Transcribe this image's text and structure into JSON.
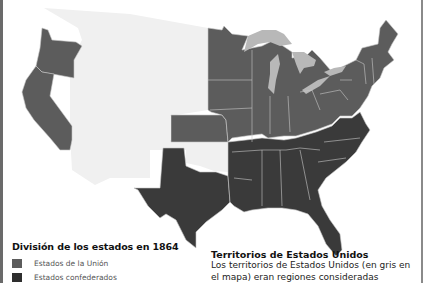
{
  "map": {
    "subject": "United States states in 1864",
    "colors": {
      "union": "#5c5c5c",
      "confederate": "#3a3a3a",
      "territory": "#f0f0f0",
      "lakes": "#b8b8b8",
      "borders": "#c8c8c8",
      "background": "#ffffff"
    },
    "regions": [
      {
        "name": "Oregon",
        "status": "union"
      },
      {
        "name": "California",
        "status": "union"
      },
      {
        "name": "Kansas",
        "status": "union"
      },
      {
        "name": "Minnesota",
        "status": "union"
      },
      {
        "name": "Iowa",
        "status": "union"
      },
      {
        "name": "Missouri",
        "status": "union"
      },
      {
        "name": "Wisconsin",
        "status": "union"
      },
      {
        "name": "Illinois",
        "status": "union"
      },
      {
        "name": "Michigan",
        "status": "union"
      },
      {
        "name": "Indiana",
        "status": "union"
      },
      {
        "name": "Ohio",
        "status": "union"
      },
      {
        "name": "Kentucky",
        "status": "union"
      },
      {
        "name": "West Virginia",
        "status": "union"
      },
      {
        "name": "Pennsylvania",
        "status": "union"
      },
      {
        "name": "New York",
        "status": "union"
      },
      {
        "name": "New England",
        "status": "union"
      },
      {
        "name": "Maryland",
        "status": "union"
      },
      {
        "name": "New Jersey",
        "status": "union"
      },
      {
        "name": "Delaware",
        "status": "union"
      },
      {
        "name": "Texas",
        "status": "confederate"
      },
      {
        "name": "Arkansas",
        "status": "confederate"
      },
      {
        "name": "Louisiana",
        "status": "confederate"
      },
      {
        "name": "Mississippi",
        "status": "confederate"
      },
      {
        "name": "Alabama",
        "status": "confederate"
      },
      {
        "name": "Tennessee",
        "status": "confederate"
      },
      {
        "name": "Georgia",
        "status": "confederate"
      },
      {
        "name": "Florida",
        "status": "confederate"
      },
      {
        "name": "South Carolina",
        "status": "confederate"
      },
      {
        "name": "North Carolina",
        "status": "confederate"
      },
      {
        "name": "Virginia",
        "status": "confederate"
      },
      {
        "name": "Western territories",
        "status": "territory"
      },
      {
        "name": "Indian Territory",
        "status": "territory"
      }
    ]
  },
  "legend": {
    "title": "División de los estados en 1864",
    "items": [
      {
        "label": "Estados de la Unión",
        "color": "#5c5c5c"
      },
      {
        "label": "Estados confederados",
        "color": "#2e2e2e"
      }
    ]
  },
  "territories_note": {
    "title": "Territorios de Estados Unidos",
    "body": "Los territorios de Estados Unidos (en gris en el mapa) eran regiones consideradas"
  }
}
